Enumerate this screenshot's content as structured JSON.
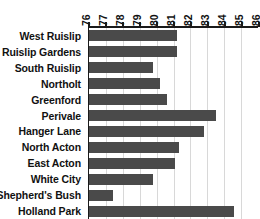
{
  "chart_data": {
    "type": "bar",
    "orientation": "horizontal",
    "title": "",
    "subtitle": "",
    "xlabel": "",
    "ylabel": "",
    "xlim": [
      76,
      86
    ],
    "ylim": null,
    "grid": true,
    "grid_axis": "x",
    "legend": null,
    "legend_position": "none",
    "xticks": [
      76,
      77,
      78,
      79,
      80,
      81,
      82,
      83,
      84,
      85,
      86
    ],
    "xtick_labels": [
      "76",
      "77",
      "78",
      "79",
      "80",
      "81",
      "82",
      "83",
      "84",
      "85",
      "86"
    ],
    "categories": [
      "West Ruislip",
      "Ruislip Gardens",
      "South Ruislip",
      "Northolt",
      "Greenford",
      "Perivale",
      "Hanger Lane",
      "North Acton",
      "East Acton",
      "White City",
      "Shepherd's Bush",
      "Holland Park"
    ],
    "values": [
      81.2,
      81.2,
      79.8,
      80.2,
      80.6,
      83.5,
      82.8,
      81.3,
      81.1,
      79.8,
      77.4,
      84.6
    ],
    "bar_color": "#4a4a4a",
    "grid_color": "#d8d8d8",
    "axis_color": "#1a1a1a",
    "background_color": "#ffffff"
  }
}
